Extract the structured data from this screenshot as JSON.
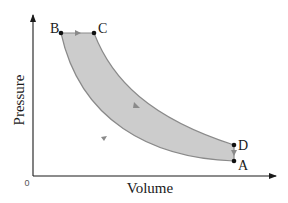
{
  "diagram": {
    "type": "pv-cycle",
    "axes": {
      "x_label": "Volume",
      "y_label": "Pressure",
      "origin_label": "0"
    },
    "points": [
      {
        "id": "A",
        "label": "A"
      },
      {
        "id": "B",
        "label": "B"
      },
      {
        "id": "C",
        "label": "C"
      },
      {
        "id": "D",
        "label": "D"
      }
    ],
    "processes": [
      {
        "from": "A",
        "to": "B",
        "shape": "curve",
        "direction": "up-left"
      },
      {
        "from": "B",
        "to": "C",
        "shape": "horizontal line",
        "direction": "right"
      },
      {
        "from": "C",
        "to": "D",
        "shape": "curve",
        "direction": "down-right"
      },
      {
        "from": "D",
        "to": "A",
        "shape": "vertical line",
        "direction": "down"
      }
    ],
    "colors": {
      "fill": "#cccccc",
      "curve": "#8a8a8a",
      "axis": "#1a1a1a",
      "point": "#111111"
    }
  }
}
